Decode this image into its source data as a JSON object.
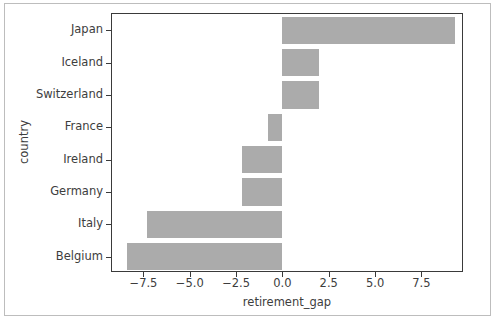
{
  "chart_data": {
    "type": "bar",
    "orientation": "horizontal",
    "title": "",
    "xlabel": "retirement_gap",
    "ylabel": "country",
    "categories": [
      "Japan",
      "Iceland",
      "Switzerland",
      "France",
      "Ireland",
      "Germany",
      "Italy",
      "Belgium"
    ],
    "values": [
      9.3,
      2.0,
      2.0,
      -0.8,
      -2.2,
      -2.2,
      -7.3,
      -8.4
    ],
    "xlim": [
      -9.2,
      9.8
    ],
    "xticks": [
      -7.5,
      -5.0,
      -2.5,
      0.0,
      2.5,
      5.0,
      7.5
    ],
    "xtick_labels": [
      "−7.5",
      "−5.0",
      "−2.5",
      "0.0",
      "2.5",
      "5.0",
      "7.5"
    ],
    "grid": false,
    "legend": false,
    "bar_color": "#ababab",
    "axis_color": "#3a3a3a",
    "background": "#ffffff"
  }
}
